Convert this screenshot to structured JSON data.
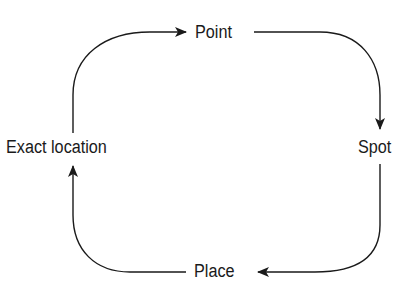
{
  "diagram": {
    "type": "cycle",
    "nodes": [
      {
        "id": "point",
        "label": "Point"
      },
      {
        "id": "spot",
        "label": "Spot"
      },
      {
        "id": "place",
        "label": "Place"
      },
      {
        "id": "exact_location",
        "label": "Exact location"
      }
    ],
    "edges": [
      {
        "from": "exact_location",
        "to": "point"
      },
      {
        "from": "point",
        "to": "spot"
      },
      {
        "from": "spot",
        "to": "place"
      },
      {
        "from": "place",
        "to": "exact_location"
      }
    ],
    "colors": {
      "line": "#1a1a1a",
      "background": "#ffffff"
    }
  }
}
